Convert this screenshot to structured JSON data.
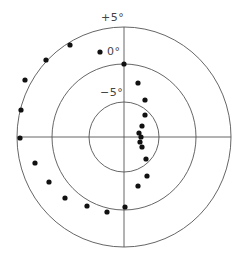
{
  "diagram": {
    "type": "polar-dot-plot",
    "center": [
      124,
      137
    ],
    "line_color": "#555555",
    "dot_color": "#111111",
    "rings": [
      {
        "label": "+5°",
        "rx": 107,
        "ry": 110
      },
      {
        "label": "0°",
        "rx": 72,
        "ry": 73
      },
      {
        "label": "−5°",
        "rx": 35,
        "ry": 35
      }
    ],
    "labels": {
      "plus5": "+5°",
      "zero": "0°",
      "minus5": "−5°"
    },
    "points": [
      [
        70,
        45
      ],
      [
        46,
        60
      ],
      [
        25,
        80
      ],
      [
        21,
        110
      ],
      [
        20,
        138
      ],
      [
        100,
        52
      ],
      [
        124,
        64
      ],
      [
        35,
        163
      ],
      [
        49,
        182
      ],
      [
        65,
        198
      ],
      [
        87,
        206
      ],
      [
        107,
        212
      ],
      [
        125,
        207
      ],
      [
        138,
        83
      ],
      [
        145,
        100
      ],
      [
        145,
        115
      ],
      [
        142,
        126
      ],
      [
        139,
        133
      ],
      [
        141,
        137
      ],
      [
        140,
        142
      ],
      [
        142,
        147
      ],
      [
        146,
        159
      ],
      [
        147,
        176
      ],
      [
        138,
        186
      ]
    ]
  }
}
